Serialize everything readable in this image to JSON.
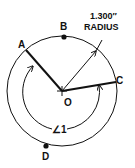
{
  "diagram": {
    "type": "geometry-circle",
    "center_label": "O",
    "points": [
      {
        "label": "A",
        "role": "point on circle, end of radius OA"
      },
      {
        "label": "B",
        "role": "marked point on circle (dot)"
      },
      {
        "label": "C",
        "role": "point on circle, end of radius OC"
      },
      {
        "label": "D",
        "role": "marked point on circle (dot)"
      }
    ],
    "radius_label_line1": "1.300″",
    "radius_label_line2": "RADIUS",
    "angle_label": "∠1",
    "colors": {
      "stroke": "#111111",
      "background": "#ffffff"
    }
  }
}
